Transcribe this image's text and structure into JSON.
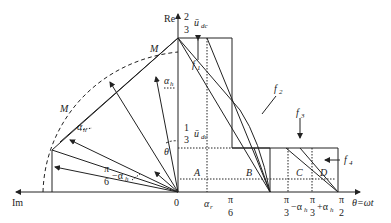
{
  "axes": {
    "re_label": "Re",
    "im_label": "Im",
    "origin_label": "0",
    "theta_axis_label": "θ=ωt"
  },
  "levels": {
    "top_num": "2",
    "top_den": "3",
    "top_var": "ū",
    "top_sub": "dc",
    "mid_num": "1",
    "mid_den": "3",
    "mid_var": "ū",
    "mid_sub": "dc"
  },
  "x_ticks": {
    "t0": "0",
    "t_alpha_r": "α",
    "t_alpha_r_sub": "r",
    "t_pi6_num": "π",
    "t_pi6_den": "6",
    "t_pi3m_num": "π",
    "t_pi3m_den": "3",
    "t_pi3m_suffix": "−α",
    "t_pi3m_sub": "h",
    "t_pi3p_num": "π",
    "t_pi3p_den": "3",
    "t_pi3p_suffix": "+α",
    "t_pi3p_sub": "h",
    "t_pi2_num": "π",
    "t_pi2_den": "2"
  },
  "regions": {
    "A": "A",
    "B": "B",
    "C": "C",
    "D": "D"
  },
  "curves": {
    "f1": "f",
    "f1_sub": "1",
    "f2": "f",
    "f2_sub": "2",
    "f3": "f",
    "f3_sub": "3",
    "f4": "f",
    "f4_sub": "4"
  },
  "vector_diagram": {
    "M_upper": "M",
    "M_lower": "M",
    "alpha_h_upper": "α",
    "alpha_h_upper_sub": "h",
    "alpha_h_lower": "α",
    "alpha_h_lower_sub": "h",
    "theta": "θ",
    "pi6_minus_num": "π",
    "pi6_minus_den": "6",
    "pi6_minus_suffix": "−α",
    "pi6_minus_sub": "h"
  }
}
